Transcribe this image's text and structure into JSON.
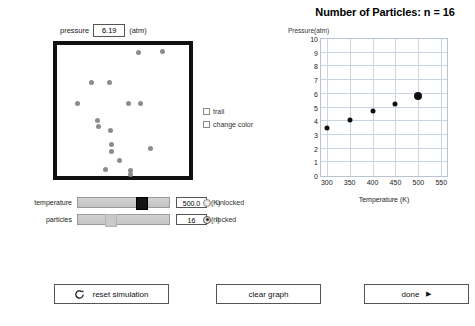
{
  "chart_data": {
    "type": "scatter",
    "title": "Number of Particles: n = 16",
    "xlabel": "Temperature (K)",
    "ylabel": "Pressure(atm)",
    "x": [
      300,
      350,
      400,
      450,
      500
    ],
    "values": [
      3.7,
      4.25,
      4.9,
      5.45,
      6.1
    ],
    "xticks": [
      300,
      350,
      400,
      450,
      500,
      550
    ],
    "yticks": [
      0,
      1,
      2,
      3,
      4,
      5,
      6,
      7,
      8,
      9,
      10
    ],
    "xlim": [
      287.5,
      562.5
    ],
    "ylim": [
      0,
      10
    ],
    "grid": true,
    "legend": "none",
    "marker_color": "#111111",
    "highlight_index": 4
  },
  "simulation": {
    "pressure_label": "pressure",
    "pressure_value": "6.19",
    "pressure_units": "(atm)",
    "particles": [
      {
        "x": 62.0,
        "y": 6.0
      },
      {
        "x": 80.0,
        "y": 5.0
      },
      {
        "x": 26.0,
        "y": 29.0
      },
      {
        "x": 40.0,
        "y": 29.0
      },
      {
        "x": 15.5,
        "y": 45.0
      },
      {
        "x": 54.5,
        "y": 45.0
      },
      {
        "x": 63.5,
        "y": 45.0
      },
      {
        "x": 30.5,
        "y": 58.0
      },
      {
        "x": 31.5,
        "y": 62.0
      },
      {
        "x": 40.5,
        "y": 65.0
      },
      {
        "x": 41.0,
        "y": 76.0
      },
      {
        "x": 41.0,
        "y": 81.0
      },
      {
        "x": 70.5,
        "y": 79.0
      },
      {
        "x": 47.5,
        "y": 88.0
      },
      {
        "x": 37.0,
        "y": 95.0
      },
      {
        "x": 55.5,
        "y": 95.5
      },
      {
        "x": 55.5,
        "y": 99.0
      }
    ]
  },
  "checkboxes": [
    {
      "label": "trail",
      "checked": false
    },
    {
      "label": "change color",
      "checked": false
    }
  ],
  "sliders": [
    {
      "label": "temperature",
      "value": "500.0",
      "unit": "(K)",
      "thumb_pct": 70
    },
    {
      "label": "particles",
      "value": "16",
      "unit": "(n)",
      "thumb_pct": 36
    }
  ],
  "radios": [
    {
      "label": "unlocked",
      "selected": false
    },
    {
      "label": "locked",
      "selected": true
    }
  ],
  "buttons": {
    "reset": "reset simulation",
    "clear": "clear graph",
    "done": "done",
    "done_arrow": "▶"
  }
}
